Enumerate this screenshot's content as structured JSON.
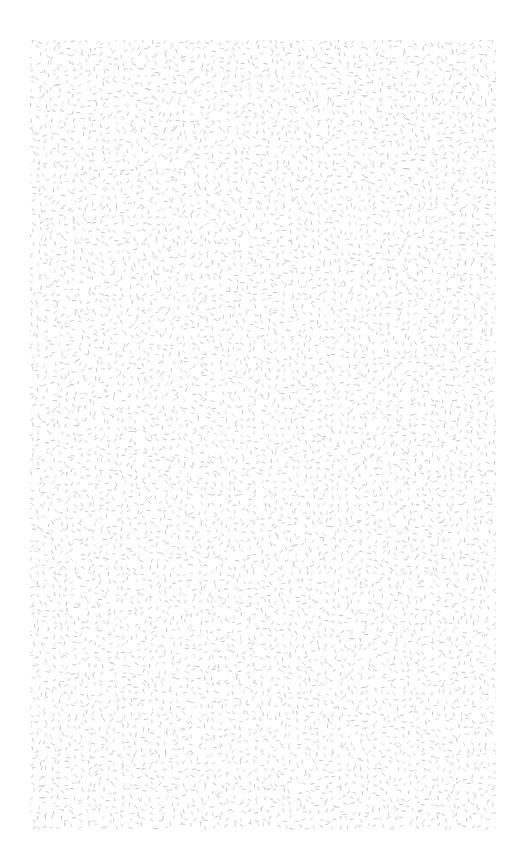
{
  "canvas": {
    "width": 524,
    "height": 861,
    "background": "#ffffff"
  },
  "texture": {
    "description": "random short grey dashes",
    "bounds": {
      "x": 30,
      "y": 40,
      "width": 466,
      "height": 790
    },
    "dash_color": "#b8b8b8",
    "dash_length": 3.2,
    "spacing": 7
  }
}
